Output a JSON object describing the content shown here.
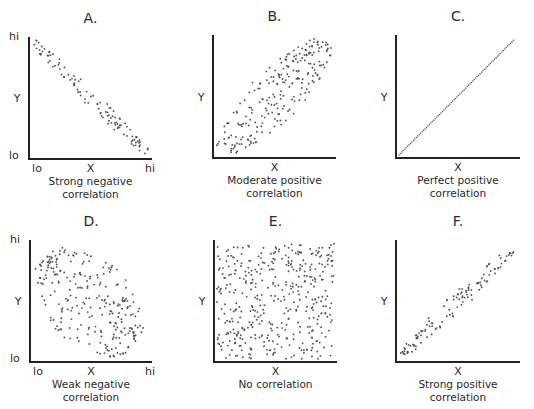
{
  "chart_data": [
    {
      "id": "A",
      "type": "scatter",
      "title": "A.",
      "xlabel": "X",
      "ylabel": "Y",
      "x_ticks": [
        "lo",
        "hi"
      ],
      "y_ticks": [
        "lo",
        "hi"
      ],
      "caption": [
        "Strong negative",
        "correlation"
      ],
      "relationship": "strong negative",
      "approx_r": -0.95,
      "approx_points": 110,
      "axes": {
        "x0": 29,
        "y0": 159,
        "x1": 152,
        "ytop": 37
      },
      "shape": {
        "kind": "band",
        "from": [
          0.02,
          0.98
        ],
        "to": [
          0.98,
          0.03
        ],
        "width": 0.14
      }
    },
    {
      "id": "B",
      "type": "scatter",
      "title": "B.",
      "xlabel": "X",
      "ylabel": "Y",
      "caption": [
        "Moderate positive",
        "correlation"
      ],
      "relationship": "moderate positive",
      "approx_r": 0.7,
      "approx_points": 230,
      "axes": {
        "x0": 213,
        "y0": 158,
        "x1": 336,
        "ytop": 35
      },
      "shape": {
        "kind": "band",
        "from": [
          0.05,
          0.04
        ],
        "to": [
          0.95,
          0.96
        ],
        "width": 0.45
      }
    },
    {
      "id": "C",
      "type": "scatter",
      "title": "C.",
      "xlabel": "X",
      "ylabel": "Y",
      "caption": [
        "Perfect positive",
        "correlation"
      ],
      "relationship": "perfect positive",
      "approx_r": 1.0,
      "approx_points": 80,
      "axes": {
        "x0": 396,
        "y0": 158,
        "x1": 520,
        "ytop": 35
      },
      "shape": {
        "kind": "line",
        "from": [
          0.0,
          0.0
        ],
        "to": [
          0.97,
          0.98
        ]
      }
    },
    {
      "id": "D",
      "type": "scatter",
      "title": "D.",
      "xlabel": "X",
      "ylabel": "Y",
      "x_ticks": [
        "lo",
        "hi"
      ],
      "y_ticks": [
        "lo",
        "hi"
      ],
      "caption": [
        "Weak negative",
        "correlation"
      ],
      "relationship": "weak negative",
      "approx_r": -0.4,
      "approx_points": 260,
      "axes": {
        "x0": 30,
        "y0": 362,
        "x1": 152,
        "ytop": 240
      },
      "shape": {
        "kind": "band",
        "from": [
          0.12,
          0.88
        ],
        "to": [
          0.86,
          0.1
        ],
        "width": 0.75
      }
    },
    {
      "id": "E",
      "type": "scatter",
      "title": "E.",
      "xlabel": "X",
      "ylabel": "Y",
      "caption": [
        "No correlation"
      ],
      "relationship": "none",
      "approx_r": 0.0,
      "approx_points": 420,
      "axes": {
        "x0": 214,
        "y0": 362,
        "x1": 337,
        "ytop": 240
      },
      "shape": {
        "kind": "uniform"
      }
    },
    {
      "id": "F",
      "type": "scatter",
      "title": "F.",
      "xlabel": "X",
      "ylabel": "Y",
      "caption": [
        "Strong positive",
        "correlation"
      ],
      "relationship": "strong positive",
      "approx_r": 0.95,
      "approx_points": 120,
      "axes": {
        "x0": 396,
        "y0": 362,
        "x1": 520,
        "ytop": 240
      },
      "shape": {
        "kind": "band",
        "from": [
          0.02,
          0.03
        ],
        "to": [
          0.96,
          0.94
        ],
        "width": 0.16
      }
    }
  ],
  "page": {
    "bleed_through_text": "...cal relationship between two variables..."
  }
}
